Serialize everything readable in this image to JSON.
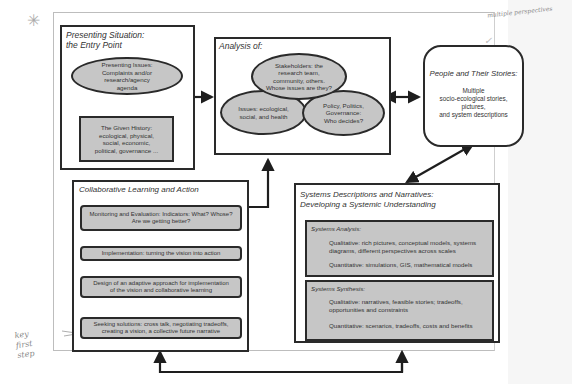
{
  "diagram": {
    "entry_point": {
      "title": "Presenting Situation:\nthe Entry Point",
      "presenting_issues": "Presenting Issues:\nComplaints and/or\nresearch/agency\nagenda",
      "given_history": "The Given History:\necological, physical,\nsocial, economic,\npolitical, governance ..."
    },
    "analysis": {
      "title": "Analysis of:",
      "stakeholders": "Stakeholders: the\nresearch team,\ncommunity, others.\nWhose issues are they?",
      "issues": "Issues: ecological,\nsocial, and health",
      "policy": "Policy, Politics,\nGovernance:\nWho decides?"
    },
    "people_stories": {
      "title": "People and Their Stories:",
      "body": "Multiple\nsocio-ecological stories,\npictures,\nand system descriptions"
    },
    "collaborative": {
      "title": "Collaborative Learning and Action",
      "steps": [
        "Monitoring and Evaluation: Indicators: What? Whose?\nAre we getting better?",
        "Implementation: turning the vision into action",
        "Design of an adaptive approach for implementation\nof the vision and collaborative learning",
        "Seeking solutions: cross talk, negotiating tradeoffs,\ncreating a vision, a collective future narrative"
      ]
    },
    "systems": {
      "title": "Systems Descriptions and Narratives:\nDeveloping a Systemic Understanding",
      "analysis": {
        "title": "Systems Analysis:",
        "qualitative": "Qualitative: rich pictures, conceptual models, systems\ndiagrams, different perspectives across scales",
        "quantitative": "Quantitative: simulations, GIS, mathematical models"
      },
      "synthesis": {
        "title": "Systems Synthesis:",
        "qualitative": "Qualitative: narratives, feasible stories; tradeoffs,\nopportunities and constraints",
        "quantitative": "Quantitative: scenarios, tradeoffs, costs and benefits"
      }
    },
    "annotations": {
      "star": "✳",
      "top_right": "multiple perspectives",
      "checkmark": "✓",
      "left_note": "key\nfirst\nstep"
    },
    "colors": {
      "fill": "#c6c6c6",
      "stroke": "#2a2a2a"
    }
  }
}
